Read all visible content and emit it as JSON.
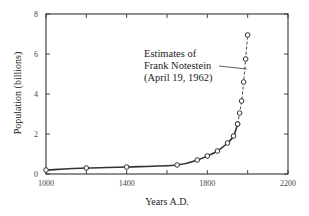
{
  "chart_data": {
    "type": "line",
    "title": "",
    "xlabel": "Years A.D.",
    "ylabel": "Population (billions)",
    "xlim": [
      1000,
      2200
    ],
    "ylim": [
      0,
      8
    ],
    "x_ticks": [
      1000,
      1200,
      1400,
      1600,
      1800,
      2000,
      2200
    ],
    "x_tick_labels": [
      "1000",
      "",
      "1400",
      "",
      "1800",
      "",
      "2200"
    ],
    "y_ticks": [
      0,
      2,
      4,
      6,
      8
    ],
    "y_tick_labels": [
      "0",
      "2",
      "4",
      "6",
      "8"
    ],
    "grid": false,
    "legend": null,
    "series": [
      {
        "name": "Historical population",
        "style": "solid",
        "marker": "open-circle",
        "x": [
          1000,
          1200,
          1400,
          1650,
          1750,
          1800,
          1850,
          1900,
          1930,
          1950
        ],
        "values": [
          0.2,
          0.3,
          0.35,
          0.45,
          0.7,
          0.9,
          1.15,
          1.55,
          1.9,
          2.5
        ]
      },
      {
        "name": "Estimates of Frank Notestein (April 19, 1962)",
        "style": "dashed",
        "marker": "open-circle",
        "x": [
          1950,
          1960,
          1970,
          1980,
          1990,
          2000
        ],
        "values": [
          2.5,
          3.05,
          3.65,
          4.6,
          5.75,
          6.95
        ]
      }
    ],
    "annotations": [
      {
        "lines": [
          "Estimates of",
          "Frank Notestein",
          "(April 19, 1962)"
        ],
        "points_to": {
          "x": 1990,
          "y": 5.2
        }
      }
    ]
  }
}
